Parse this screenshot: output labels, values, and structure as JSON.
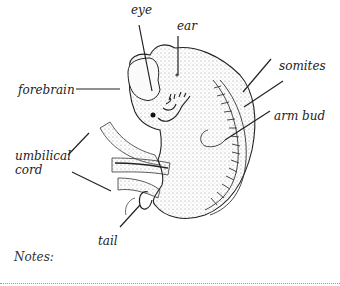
{
  "diagram": {
    "labels": {
      "eye": "eye",
      "ear": "ear",
      "forebrain": "forebrain",
      "somites": "somites",
      "arm_bud": "arm bud",
      "umbilical_cord_line1": "umbilical",
      "umbilical_cord_line2": "cord",
      "tail": "tail"
    }
  },
  "notes": {
    "label": "Notes:"
  }
}
